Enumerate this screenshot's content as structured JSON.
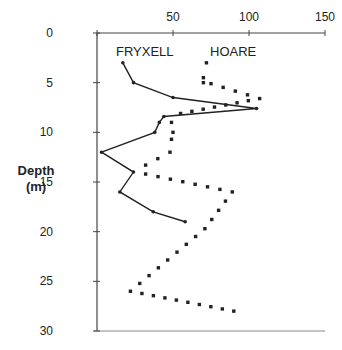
{
  "chart_data": {
    "type": "line",
    "title": "",
    "xlabel": "",
    "ylabel": "Depth\n(m)",
    "ylabel_lines": [
      "Depth",
      "(m)"
    ],
    "x_axis_position": "top",
    "y_axis_inverted": true,
    "xlim": [
      0,
      150
    ],
    "ylim": [
      0,
      30
    ],
    "x_ticks": [
      0,
      50,
      100,
      150
    ],
    "x_tick_labels": [
      "",
      "50",
      "100",
      "150"
    ],
    "y_ticks": [
      0,
      5,
      10,
      15,
      20,
      25,
      30
    ],
    "y_tick_labels": [
      "0",
      "5",
      "10",
      "15",
      "20",
      "25",
      "30"
    ],
    "grid": false,
    "legend": "inline labels",
    "series": [
      {
        "name": "FRYXELL",
        "style": "solid line with point markers",
        "color": "#222222",
        "points": [
          {
            "x": 17,
            "depth": 3
          },
          {
            "x": 24,
            "depth": 5
          },
          {
            "x": 50,
            "depth": 6.5
          },
          {
            "x": 105,
            "depth": 7.6
          },
          {
            "x": 44,
            "depth": 8.4
          },
          {
            "x": 41,
            "depth": 9
          },
          {
            "x": 38,
            "depth": 10
          },
          {
            "x": 3,
            "depth": 12
          },
          {
            "x": 24,
            "depth": 14
          },
          {
            "x": 15,
            "depth": 16
          },
          {
            "x": 37,
            "depth": 18
          },
          {
            "x": 58,
            "depth": 19
          }
        ]
      },
      {
        "name": "HOARE",
        "style": "dotted line",
        "color": "#222222",
        "points": [
          {
            "x": 72,
            "depth": 3
          },
          {
            "x": 70,
            "depth": 4.5
          },
          {
            "x": 70,
            "depth": 5
          },
          {
            "x": 75,
            "depth": 5.1
          },
          {
            "x": 107,
            "depth": 6.6
          },
          {
            "x": 55,
            "depth": 8.1
          },
          {
            "x": 49,
            "depth": 9
          },
          {
            "x": 50,
            "depth": 10
          },
          {
            "x": 49,
            "depth": 10.7
          },
          {
            "x": 48,
            "depth": 12
          },
          {
            "x": 32,
            "depth": 13.3
          },
          {
            "x": 32,
            "depth": 14.2
          },
          {
            "x": 89,
            "depth": 16
          },
          {
            "x": 71,
            "depth": 19.7
          },
          {
            "x": 22,
            "depth": 26
          },
          {
            "x": 90,
            "depth": 28
          }
        ]
      }
    ]
  }
}
